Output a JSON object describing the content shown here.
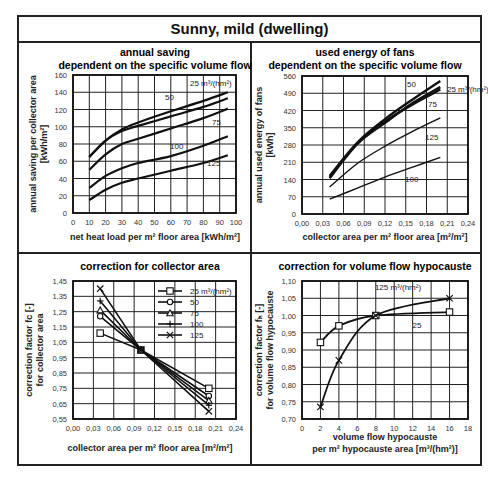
{
  "page": {
    "title": "Sunny, mild (dwelling)"
  },
  "chart_data": [
    {
      "id": "annual-saving",
      "type": "line",
      "title": "annual saving",
      "subtitle": "dependent on the specific volume flow",
      "xlabel": "net heat load per m² floor area [kWh/m²]",
      "ylabel": [
        "annual saving per collector area",
        "[kWh/m²]"
      ],
      "xlim": [
        0,
        100
      ],
      "ylim": [
        0,
        160
      ],
      "xticks": [
        0,
        10,
        20,
        30,
        40,
        50,
        60,
        70,
        80,
        90,
        100
      ],
      "yticks": [
        0,
        20,
        40,
        60,
        80,
        100,
        120,
        140,
        160
      ],
      "grid": true,
      "series": [
        {
          "name": "25 m³/(hm²)",
          "x": [
            10,
            20,
            30,
            40,
            60,
            80,
            95
          ],
          "y": [
            65,
            84,
            97,
            105,
            118,
            130,
            140
          ]
        },
        {
          "name": "50",
          "x": [
            10,
            20,
            30,
            40,
            60,
            80,
            95
          ],
          "y": [
            65,
            84,
            95,
            101,
            112,
            123,
            133
          ]
        },
        {
          "name": "75",
          "x": [
            10,
            20,
            30,
            40,
            60,
            80,
            95
          ],
          "y": [
            50,
            68,
            80,
            86,
            98,
            110,
            121
          ]
        },
        {
          "name": "100",
          "x": [
            10,
            20,
            30,
            40,
            60,
            80,
            95
          ],
          "y": [
            29,
            43,
            52,
            58,
            66,
            78,
            89
          ]
        },
        {
          "name": "125",
          "x": [
            10,
            20,
            30,
            40,
            60,
            80,
            95
          ],
          "y": [
            15,
            27,
            35,
            40,
            49,
            58,
            67
          ]
        }
      ],
      "annotations": [
        "25 m³/(hm²)",
        "50",
        "75",
        "100",
        "125"
      ]
    },
    {
      "id": "fan-energy",
      "type": "line",
      "title": "used energy of fans",
      "subtitle": "dependent on the specific volume flow",
      "xlabel": "collector area per m² floor area [m²/m²]",
      "ylabel": [
        "annual used energy of fans",
        "[kWh]"
      ],
      "xlim": [
        0,
        0.24
      ],
      "ylim": [
        0,
        560
      ],
      "xticks": [
        "0,00",
        "0,03",
        "0,06",
        "0,09",
        "0,12",
        "0,15",
        "0,18",
        "0,21",
        "0,24"
      ],
      "yticks": [
        0,
        70,
        140,
        210,
        280,
        350,
        420,
        490,
        560
      ],
      "grid": true,
      "series": [
        {
          "name": "25 m³/(hm²)",
          "x": [
            0.04,
            0.08,
            0.12,
            0.16,
            0.2
          ],
          "y": [
            60,
            105,
            150,
            190,
            230
          ]
        },
        {
          "name": "50",
          "x": [
            0.04,
            0.08,
            0.12,
            0.16,
            0.2
          ],
          "y": [
            110,
            205,
            275,
            335,
            390
          ]
        },
        {
          "name": "75",
          "x": [
            0.04,
            0.08,
            0.12,
            0.16,
            0.2
          ],
          "y": [
            145,
            285,
            375,
            445,
            505
          ]
        },
        {
          "name": "100",
          "x": [
            0.04,
            0.08,
            0.12,
            0.16,
            0.2
          ],
          "y": [
            155,
            290,
            385,
            465,
            540
          ]
        },
        {
          "name": "125",
          "x": [
            0.04,
            0.08,
            0.12,
            0.16,
            0.2
          ],
          "y": [
            150,
            285,
            370,
            450,
            515
          ]
        }
      ],
      "annotations": [
        "100",
        "125",
        "75",
        "50",
        "25 m³/(hm²)"
      ]
    },
    {
      "id": "collector-correction",
      "type": "line",
      "title": "correction for collector area",
      "xlabel": "collector area per m² floor area [m²/m²]",
      "ylabel": [
        "correction factor fc [-]",
        "for collector area"
      ],
      "xlim": [
        0,
        0.24
      ],
      "ylim": [
        0.55,
        1.45
      ],
      "xticks": [
        "0,00",
        "0,03",
        "0,06",
        "0,09",
        "0,12",
        "0,15",
        "0,18",
        "0,21",
        "0,24"
      ],
      "yticks": [
        "0,55",
        "0,65",
        "0,75",
        "0,85",
        "0,95",
        "1,05",
        "1,15",
        "1,25",
        "1,35",
        "1,45"
      ],
      "grid": true,
      "legend_position": "upper right",
      "legend": [
        "25 m³/(hm²)",
        "50",
        "75",
        "100",
        "125"
      ],
      "series": [
        {
          "name": "25 m³/(hm²)",
          "marker": "square",
          "x": [
            0.04,
            0.1,
            0.2
          ],
          "y": [
            1.11,
            1.0,
            0.75
          ]
        },
        {
          "name": "50",
          "marker": "circle",
          "x": [
            0.04,
            0.1,
            0.2
          ],
          "y": [
            1.22,
            1.0,
            0.7
          ]
        },
        {
          "name": "75",
          "marker": "triangle",
          "x": [
            0.04,
            0.1,
            0.2
          ],
          "y": [
            1.26,
            1.0,
            0.67
          ]
        },
        {
          "name": "100",
          "marker": "plus",
          "x": [
            0.04,
            0.1,
            0.2
          ],
          "y": [
            1.32,
            1.0,
            0.64
          ]
        },
        {
          "name": "125",
          "marker": "x",
          "x": [
            0.04,
            0.1,
            0.2
          ],
          "y": [
            1.4,
            1.0,
            0.6
          ]
        }
      ]
    },
    {
      "id": "hypocaust-correction",
      "type": "line",
      "title": "correction for volume flow hypocauste",
      "xlabel": [
        "volume flow hypocauste",
        "per m² hypocauste area [m³/(hm²)]"
      ],
      "ylabel": [
        "correction factor fₕ [-]",
        "for volume flow  hypocauste"
      ],
      "xlim": [
        0,
        18
      ],
      "ylim": [
        0.7,
        1.1
      ],
      "xticks": [
        0,
        2,
        4,
        6,
        8,
        10,
        12,
        14,
        16,
        18
      ],
      "yticks": [
        "0,70",
        "0,75",
        "0,80",
        "0,85",
        "0,90",
        "0,95",
        "1,00",
        "1,05",
        "1,10"
      ],
      "grid": true,
      "series": [
        {
          "name": "25",
          "marker": "square",
          "x": [
            2,
            4,
            8,
            16
          ],
          "y": [
            0.922,
            0.97,
            1.0,
            1.01
          ]
        },
        {
          "name": "125 m³/(hm²)",
          "marker": "x",
          "x": [
            2,
            4,
            8,
            16
          ],
          "y": [
            0.735,
            0.87,
            1.0,
            1.05
          ]
        }
      ]
    }
  ]
}
